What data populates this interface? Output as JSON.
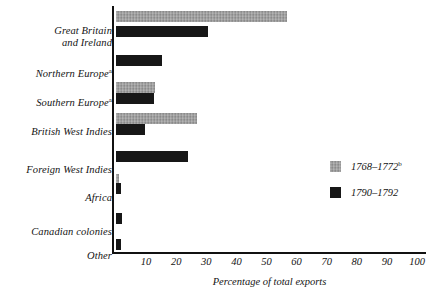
{
  "chart_data": {
    "type": "bar",
    "orientation": "horizontal",
    "title": "",
    "xlabel": "Percentage of total exports",
    "ylabel": "",
    "xlim": [
      0,
      100
    ],
    "xticks": [
      10,
      20,
      30,
      40,
      50,
      60,
      70,
      80,
      90,
      100
    ],
    "xtick_labels": [
      "10",
      "20",
      "30",
      "40",
      "50",
      "60",
      "70",
      "80",
      "90",
      "100"
    ],
    "grid": false,
    "legend_position": "right",
    "categories": [
      "Great Britain\nand Ireland",
      "Northern Europe",
      "Southern Europe",
      "British West Indies",
      "Foreign West Indies",
      "Africa",
      "Canadian colonies",
      "Other"
    ],
    "category_footnotes": [
      "",
      "a",
      "a",
      "",
      "",
      "",
      "",
      ""
    ],
    "series": [
      {
        "name": "1768–1772",
        "footnote": "b",
        "color": "#9a9a9a",
        "values": [
          56.8,
          0,
          13.0,
          27.0,
          0,
          1.0,
          0,
          0
        ]
      },
      {
        "name": "1790–1792",
        "footnote": "",
        "color": "#171717",
        "values": [
          30.6,
          15.3,
          12.6,
          9.6,
          24.0,
          1.5,
          2.0,
          1.5
        ]
      }
    ]
  },
  "axis": {
    "x_title": "Percentage of total exports"
  },
  "legend": {
    "entries": [
      {
        "label": "1768–1772",
        "sup": "b"
      },
      {
        "label": "1790–1792",
        "sup": ""
      }
    ]
  }
}
